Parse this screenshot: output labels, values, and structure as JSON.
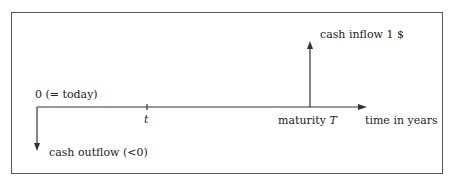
{
  "diagram": {
    "type": "cash-flow timeline",
    "origin_label": "0 (= today)",
    "tick_label": "t",
    "maturity_label_prefix": "maturity ",
    "maturity_symbol": "T",
    "axis_label": "time in years",
    "inflow_label": "cash inflow 1 $",
    "outflow_label": "cash outflow (<0)",
    "colors": {
      "line": "#333333",
      "frame": "#555555",
      "text": "#222222",
      "background": "#ffffff"
    }
  }
}
